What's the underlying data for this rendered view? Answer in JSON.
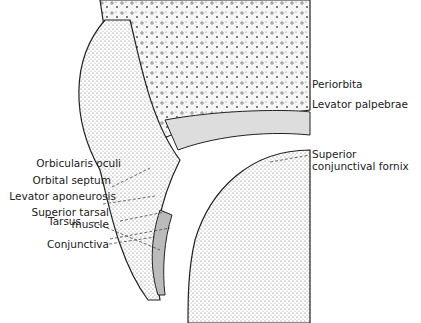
{
  "labels_left": [
    {
      "text": "Orbicularis oculi"
    },
    {
      "text": "Orbital septum"
    },
    {
      "text": "Levator aponeurosis"
    },
    {
      "text": "Superior tarsal"
    },
    {
      "text": "muscle"
    },
    {
      "text": "Tarsus"
    },
    {
      "text": "Conjunctiva"
    }
  ],
  "labels_right": [
    {
      "text": "Periorbita"
    },
    {
      "text": "Levator palpebrae"
    },
    {
      "text": "Superior"
    },
    {
      "text": "conjunctival fornix"
    }
  ]
}
